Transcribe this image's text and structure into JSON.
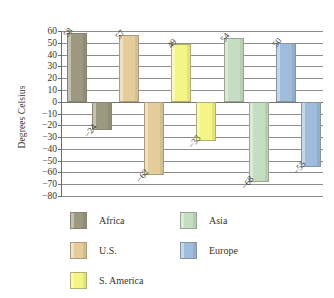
{
  "chart_data": {
    "type": "bar",
    "title": "",
    "subtitle": "",
    "xlabel": "",
    "ylabel": "Degrees Celsius",
    "ylim": [
      -80,
      60
    ],
    "ytick_step": 10,
    "yticks": [
      "60",
      "50",
      "40",
      "30",
      "20",
      "10",
      "0",
      "−10",
      "−20",
      "−30",
      "−40",
      "−50",
      "−60",
      "−70",
      "−80"
    ],
    "ytick_values": [
      60,
      50,
      40,
      30,
      20,
      10,
      0,
      -10,
      -20,
      -30,
      -40,
      -50,
      -60,
      -70,
      -80
    ],
    "grid": "horizontal",
    "legend_position": "bottom",
    "categories": [
      "Africa",
      "U.S.",
      "S. America",
      "Asia",
      "Europe"
    ],
    "series": [
      {
        "name": "Record high",
        "values": [
          58,
          57,
          49,
          54,
          50
        ],
        "labels": [
          "58",
          "57",
          "49",
          "54",
          "50"
        ]
      },
      {
        "name": "Record low",
        "values": [
          -24,
          -62,
          -33,
          -68,
          -55
        ],
        "labels": [
          "−24",
          "−62",
          "−33",
          "−68",
          "−55"
        ]
      }
    ],
    "colors": {
      "Africa": "#9d9880",
      "U.S.": "#e4cd9a",
      "S. America": "#f5f585",
      "Asia": "#c5ddc2",
      "Europe": "#9fbcdd"
    },
    "legend": [
      {
        "label": "Africa",
        "color": "#9d9880"
      },
      {
        "label": "U.S.",
        "color": "#e4cd9a"
      },
      {
        "label": "S. America",
        "color": "#f5f585"
      },
      {
        "label": "Asia",
        "color": "#c5ddc2"
      },
      {
        "label": "Europe",
        "color": "#9fbcdd"
      }
    ]
  }
}
